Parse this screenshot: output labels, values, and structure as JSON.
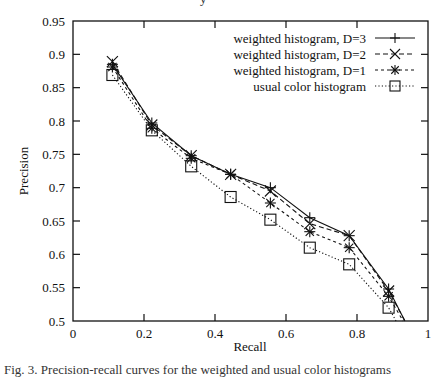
{
  "chart_data": {
    "type": "line",
    "title": "",
    "xlabel": "Recall",
    "ylabel": "Precision",
    "xlim": [
      0,
      1
    ],
    "ylim": [
      0.5,
      0.95
    ],
    "grid": false,
    "legend_position": "top-right",
    "x_ticks": [
      "0",
      "0.2",
      "0.4",
      "0.6",
      "0.8",
      "1"
    ],
    "y_ticks": [
      "0.5",
      "0.55",
      "0.6",
      "0.65",
      "0.7",
      "0.75",
      "0.8",
      "0.85",
      "0.9",
      "0.95"
    ],
    "series": [
      {
        "name": "weighted histogram, D=3",
        "line_style": "solid",
        "marker": "plus",
        "x": [
          0.111,
          0.222,
          0.333,
          0.444,
          0.556,
          0.667,
          0.778,
          0.889,
          0.935
        ],
        "y": [
          0.885,
          0.797,
          0.748,
          0.72,
          0.7,
          0.655,
          0.628,
          0.548,
          0.5
        ]
      },
      {
        "name": "weighted histogram, D=2",
        "line_style": "dashed",
        "marker": "x",
        "x": [
          0.111,
          0.222,
          0.333,
          0.444,
          0.556,
          0.667,
          0.778,
          0.889,
          0.935
        ],
        "y": [
          0.889,
          0.794,
          0.748,
          0.72,
          0.695,
          0.646,
          0.628,
          0.545,
          0.5
        ]
      },
      {
        "name": "weighted histogram, D=1",
        "line_style": "dash-dot",
        "marker": "asterisk",
        "x": [
          0.111,
          0.222,
          0.333,
          0.444,
          0.556,
          0.667,
          0.778,
          0.889,
          0.93
        ],
        "y": [
          0.881,
          0.789,
          0.744,
          0.72,
          0.677,
          0.634,
          0.61,
          0.537,
          0.5
        ]
      },
      {
        "name": "usual color histogram",
        "line_style": "dotted",
        "marker": "square",
        "x": [
          0.111,
          0.222,
          0.333,
          0.444,
          0.556,
          0.667,
          0.778,
          0.889,
          0.91
        ],
        "y": [
          0.869,
          0.786,
          0.732,
          0.686,
          0.652,
          0.61,
          0.585,
          0.52,
          0.5
        ]
      }
    ]
  },
  "cut_text": {
    "top": "y",
    "bottom": "Fig. 3. Precision-recall curves for the weighted and usual color histograms"
  }
}
